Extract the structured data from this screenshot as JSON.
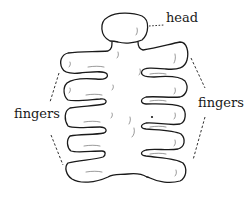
{
  "diagram": {
    "labels": {
      "head": "head",
      "fingers_left": "fingers",
      "fingers_right": "fingers"
    },
    "colors": {
      "stroke": "#1a1a1a",
      "background": "#ffffff"
    }
  }
}
